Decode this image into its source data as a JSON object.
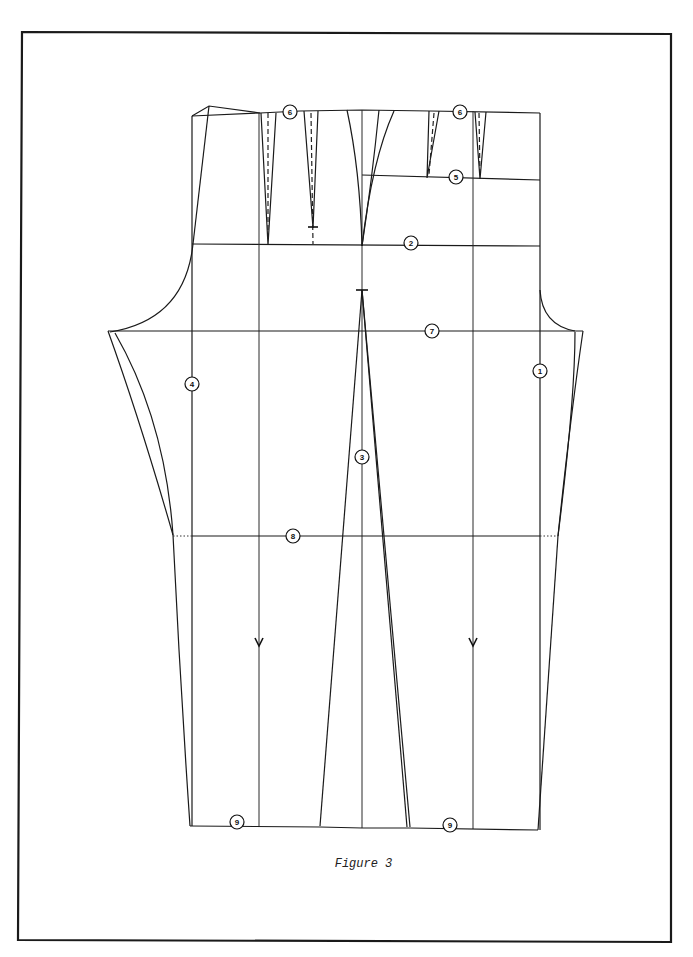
{
  "figure": {
    "caption": "Figure 3"
  },
  "markers": [
    {
      "id": "marker-1",
      "label": "1",
      "x": 540,
      "y": 371
    },
    {
      "id": "marker-2",
      "label": "2",
      "x": 411,
      "y": 243
    },
    {
      "id": "marker-3",
      "label": "3",
      "x": 362,
      "y": 457
    },
    {
      "id": "marker-4",
      "label": "4",
      "x": 192,
      "y": 384
    },
    {
      "id": "marker-5",
      "label": "5",
      "x": 456,
      "y": 177
    },
    {
      "id": "marker-6a",
      "label": "6",
      "x": 290,
      "y": 112
    },
    {
      "id": "marker-6b",
      "label": "6",
      "x": 460,
      "y": 112
    },
    {
      "id": "marker-7",
      "label": "7",
      "x": 432,
      "y": 331
    },
    {
      "id": "marker-8",
      "label": "8",
      "x": 293,
      "y": 536
    },
    {
      "id": "marker-9a",
      "label": "9",
      "x": 237,
      "y": 822
    },
    {
      "id": "marker-9b",
      "label": "9",
      "x": 450,
      "y": 825
    }
  ],
  "colors": {
    "line": "#1a1a1a",
    "background": "#ffffff"
  }
}
